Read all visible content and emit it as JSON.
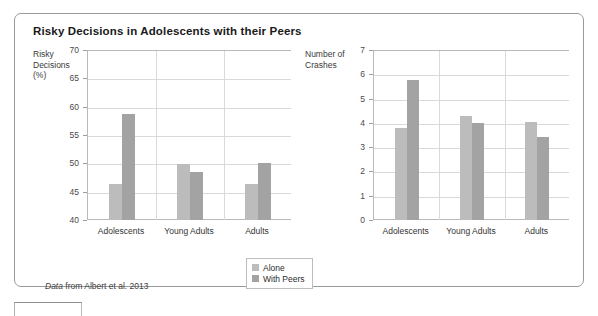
{
  "figure": {
    "title": "Risky Decisions in Adolescents with their Peers",
    "source_note_emphasis": "Data",
    "source_note_rest": " from Albert et al. 2013"
  },
  "legend": {
    "items": [
      {
        "label": "Alone",
        "color": "#bcbcbc"
      },
      {
        "label": "With Peers",
        "color": "#a3a3a3"
      }
    ]
  },
  "chart_data": [
    {
      "type": "bar",
      "title": "Risky Decisions in Adolescents with their Peers",
      "panel": "left",
      "ylabel": "Risky\nDecisions\n(%)",
      "xlabel": "",
      "categories": [
        "Adolescents",
        "Young Adults",
        "Adults"
      ],
      "series": [
        {
          "name": "Alone",
          "color": "#bcbcbc",
          "values": [
            46.3,
            49.9,
            46.3
          ]
        },
        {
          "name": "With Peers",
          "color": "#a3a3a3",
          "values": [
            58.7,
            48.4,
            50.0
          ]
        }
      ],
      "ylim": [
        40,
        70
      ],
      "yticks": [
        40,
        45,
        50,
        55,
        60,
        65,
        70
      ],
      "ytick_labels": [
        "40",
        "45",
        "50",
        "55",
        "60",
        "65",
        "70"
      ],
      "grid": true,
      "legend_position": "below-center"
    },
    {
      "type": "bar",
      "panel": "right",
      "ylabel": "Number of\nCrashes",
      "xlabel": "",
      "categories": [
        "Adolescents",
        "Young Adults",
        "Adults"
      ],
      "series": [
        {
          "name": "Alone",
          "color": "#bcbcbc",
          "values": [
            3.8,
            4.3,
            4.05
          ]
        },
        {
          "name": "With Peers",
          "color": "#a3a3a3",
          "values": [
            5.75,
            4.0,
            3.4
          ]
        }
      ],
      "ylim": [
        0,
        7
      ],
      "yticks": [
        0,
        1,
        2,
        3,
        4,
        5,
        6,
        7
      ],
      "ytick_labels": [
        "0",
        "1",
        "2",
        "3",
        "4",
        "5",
        "6",
        "7"
      ],
      "grid": true,
      "legend_position": "below-center"
    }
  ]
}
